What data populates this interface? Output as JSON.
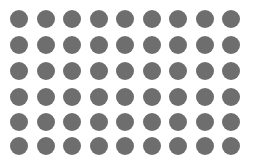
{
  "grid": {
    "rows": 6,
    "cols": 9,
    "dot_diameter": 18,
    "dot_color": "#6e6e6e",
    "background": "#ffffff",
    "col_centers": [
      19,
      45.5,
      72,
      98.5,
      125,
      151.5,
      178,
      204.5,
      231
    ],
    "row_centers": [
      19,
      45,
      71,
      97,
      122,
      146
    ]
  }
}
